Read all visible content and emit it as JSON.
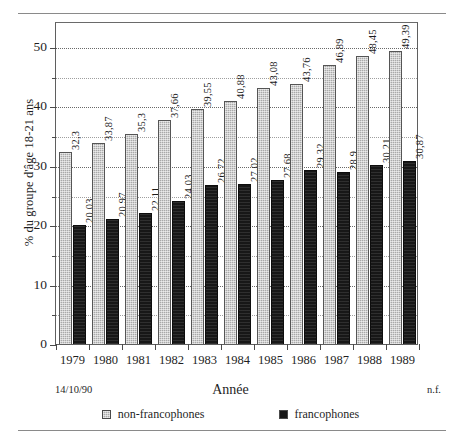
{
  "chart_data": {
    "type": "bar",
    "title": "",
    "xlabel": "Année",
    "ylabel": "% du groupe d'âge 18-21 ans",
    "ylim": [
      0,
      55
    ],
    "ytick_labels": [
      "0",
      "10",
      "20",
      "30",
      "40",
      "50"
    ],
    "ytick_values": [
      0,
      10,
      20,
      30,
      40,
      50
    ],
    "yminor_values": [
      5,
      15,
      25,
      35,
      45
    ],
    "grid": "horizontal-dotted",
    "legend_position": "bottom-center",
    "categories": [
      "1979",
      "1980",
      "1981",
      "1982",
      "1983",
      "1984",
      "1985",
      "1986",
      "1987",
      "1988",
      "1989"
    ],
    "series": [
      {
        "name": "non-francophones",
        "color": "#a9a9a9",
        "values": [
          32.3,
          33.87,
          35.3,
          37.66,
          39.55,
          40.88,
          43.08,
          43.76,
          46.89,
          48.45,
          49.39
        ],
        "labels": [
          "32,3",
          "33,87",
          "35,3",
          "37,66",
          "39,55",
          "40,88",
          "43,08",
          "43,76",
          "46,89",
          "48,45",
          "49,39"
        ]
      },
      {
        "name": "francophones",
        "color": "#171717",
        "values": [
          20.03,
          20.97,
          22.11,
          24.03,
          26.72,
          27.02,
          27.68,
          29.32,
          28.9,
          30.21,
          30.87
        ],
        "labels": [
          "20,03",
          "20,97",
          "22,11",
          "24,03",
          "26,72",
          "27,02",
          "27,68",
          "29,32",
          "28,9",
          "30,21",
          "30,87"
        ]
      }
    ]
  },
  "notes": {
    "date": "14/10/90",
    "source_code": "n.f."
  },
  "legend": {
    "items": [
      {
        "label": "non-francophones",
        "color": "#a9a9a9"
      },
      {
        "label": "francophones",
        "color": "#171717"
      }
    ]
  }
}
